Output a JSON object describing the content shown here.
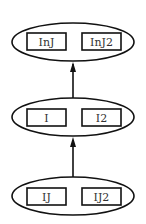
{
  "diagram": {
    "nodes": [
      {
        "id": "top",
        "boxes": [
          "InJ",
          "InJ2"
        ]
      },
      {
        "id": "middle",
        "boxes": [
          "I",
          "I2"
        ]
      },
      {
        "id": "bottom",
        "boxes": [
          "IJ",
          "IJ2"
        ]
      }
    ],
    "edges": [
      {
        "from": "bottom",
        "to": "middle"
      },
      {
        "from": "middle",
        "to": "top"
      }
    ],
    "colors": {
      "stroke": "#111111",
      "background": "#ffffff",
      "text": "#333333"
    }
  }
}
